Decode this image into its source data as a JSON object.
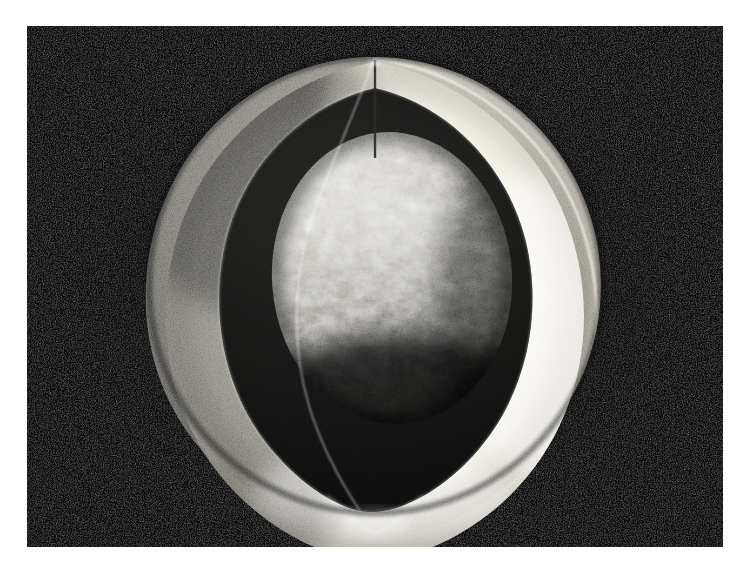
{
  "figure": {
    "kind": "cutaway-sphere-illustration",
    "medium": "grayscale airbrush / halftone print",
    "title": "Cutaway sphere revealing inner core",
    "description": "A grayscale rendering of a spherical body with a wedge cut away, exposing a thick smooth shell and a mottled rocky inner core suspended within a dark cavity.",
    "caption": "",
    "background_style": "dark speckled field"
  },
  "canvas": {
    "width": 748,
    "height": 572,
    "page_background": "#ffffff",
    "plate": {
      "x": 27,
      "y": 26,
      "width": 696,
      "height": 521,
      "fill": "#0a0a0a",
      "grain": "fine speckle"
    }
  },
  "palette": {
    "page_white": "#ffffff",
    "background_black": "#0a0a0a",
    "background_speckle": "#3a3a3a",
    "shell_cut_face": "#b9b9b6",
    "shell_cut_face_shadow": "#8e8e8c",
    "shell_outer_light": "#cfcfcb",
    "shell_outer_mid": "#a9a9a5",
    "shell_outer_dark": "#6e6e6c",
    "shell_inner_wall_highlight": "#f4f2ec",
    "shell_inner_wall_mid": "#d6d4cd",
    "shell_inner_wall_shadow": "#6a6a67",
    "cut_edge_line": "#fbfaf6",
    "cavity_shadow": "#111111",
    "core_highlight": "#efeee8",
    "core_mid": "#8d8c87",
    "core_dark": "#232322",
    "core_shadow": "#0f0f0f",
    "seam_line": "#3d3d3b"
  },
  "geometry": {
    "sphere": {
      "center_x": 375,
      "center_y": 285,
      "radius_x": 226,
      "radius_y": 228,
      "note": "outer sphere silhouette within the full 748x572 page coordinates"
    },
    "core": {
      "center_x": 392,
      "center_y": 278,
      "radius_x": 120,
      "radius_y": 145,
      "note": "inner rocky core, teardrop-shaded"
    },
    "cut": {
      "type": "wedge",
      "apex_top_x": 375,
      "apex_top_y": 58,
      "cusp_bottom_x": 372,
      "cusp_bottom_y": 506,
      "seam_visible": true
    },
    "light": {
      "direction": "upper-left",
      "key_highlight_x": 405,
      "key_highlight_y": 235
    }
  },
  "layers": [
    {
      "id": "background",
      "label": "Dark speckled background field",
      "order": 0
    },
    {
      "id": "shell-outer",
      "label": "Outer sphere shell exterior surface",
      "order": 1
    },
    {
      "id": "shell-cut-face",
      "label": "Flat cut face of the shell (left wedge wall)",
      "order": 2
    },
    {
      "id": "shell-inner-wall",
      "label": "Illuminated inner wall of the shell",
      "order": 3
    },
    {
      "id": "cavity",
      "label": "Dark cavity between shell and core",
      "order": 4
    },
    {
      "id": "core",
      "label": "Mottled rocky inner core",
      "order": 5
    },
    {
      "id": "cut-edge",
      "label": "Bright rim line along the cut edge",
      "order": 6
    },
    {
      "id": "seam",
      "label": "Vertical seam from apex down the cut face",
      "order": 7
    }
  ],
  "annotations": {
    "labels": [],
    "legend": [],
    "scale_bar": null,
    "axis_text": []
  }
}
